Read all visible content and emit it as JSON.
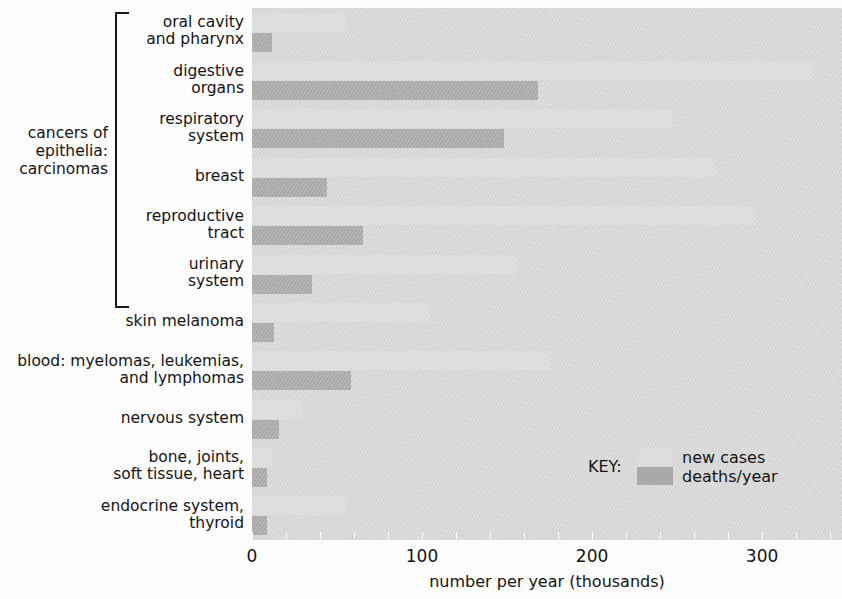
{
  "chart_data": {
    "type": "bar",
    "orientation": "horizontal",
    "title": "",
    "xlabel": "number per year (thousands)",
    "ylabel": "",
    "xlim": [
      0,
      347
    ],
    "xticks": [
      0,
      100,
      200,
      300
    ],
    "xtick_labels": [
      "0",
      "100",
      "200",
      "300"
    ],
    "minor_tick_interval": 20,
    "grid": false,
    "legend": {
      "position": "inside-lower-right",
      "key_label": "KEY:",
      "entries": [
        "new cases",
        "deaths/year"
      ]
    },
    "categories": [
      "oral cavity\nand pharynx",
      "digestive\norgans",
      "respiratory\nsystem",
      "breast",
      "reproductive\ntract",
      "urinary\nsystem",
      "skin melanoma",
      "blood: myelomas, leukemias,\nand lymphomas",
      "nervous system",
      "bone, joints,\nsoft tissue, heart",
      "endocrine system,\nthyroid"
    ],
    "series": [
      {
        "name": "new cases",
        "color": "#dcdcdc",
        "values": [
          56,
          330,
          247,
          273,
          296,
          156,
          104,
          176,
          30,
          12,
          55
        ]
      },
      {
        "name": "deaths/year",
        "color": "#a9a9a9",
        "values": [
          12,
          168,
          148,
          44,
          65,
          35,
          13,
          58,
          16,
          9,
          9
        ]
      }
    ],
    "group_bracket": {
      "label": "cancers of\nepithelia:\ncarcinomas",
      "covers_categories": [
        0,
        1,
        2,
        3,
        4,
        5
      ]
    },
    "colors": {
      "plot_background": "#d5d5d5",
      "new_cases": "#dcdcdc",
      "deaths_per_year": "#a9a9a9",
      "text": "#141414",
      "page_background": "#fdfdfd"
    }
  }
}
